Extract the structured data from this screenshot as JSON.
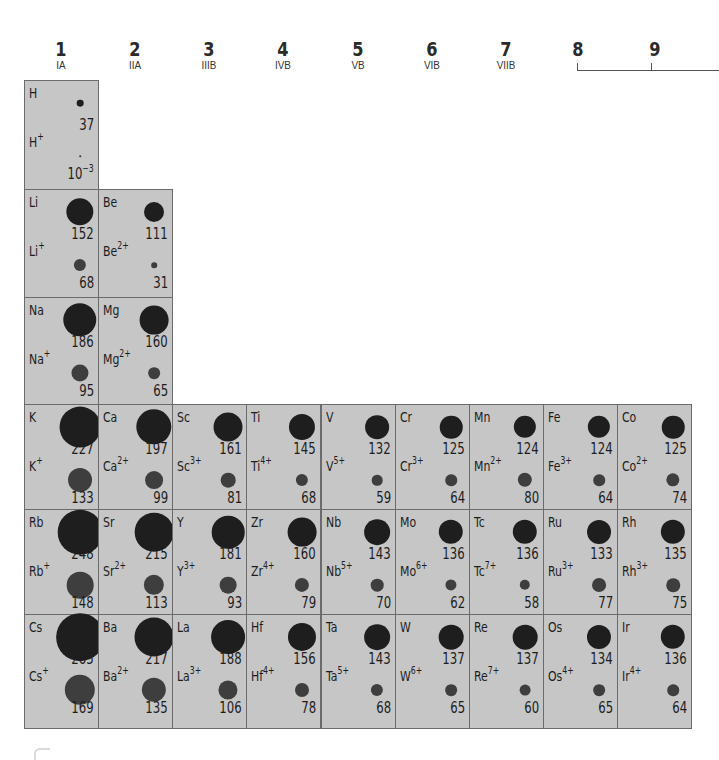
{
  "groups": [
    {
      "num": "1",
      "roman": "IA"
    },
    {
      "num": "2",
      "roman": "IIA"
    },
    {
      "num": "3",
      "roman": "IIIB"
    },
    {
      "num": "4",
      "roman": "IVB"
    },
    {
      "num": "5",
      "roman": "VB"
    },
    {
      "num": "6",
      "roman": "VIB"
    },
    {
      "num": "7",
      "roman": "VIIB"
    },
    {
      "num": "8",
      "roman": ""
    },
    {
      "num": "9",
      "roman": ""
    }
  ],
  "colors": {
    "cell_bg": "#c6c6c6",
    "cell_border": "#6b6b6b",
    "atom_dot": "#1e1e1e",
    "ion_dot": "#3e3e3e"
  },
  "elements": [
    {
      "sym": "H",
      "atomic_radius": "37",
      "ion": "H",
      "charge": "+",
      "ionic_radius": "10",
      "ionic_exp": "−3",
      "col": 0,
      "row": 0
    },
    {
      "sym": "Li",
      "atomic_radius": "152",
      "ion": "Li",
      "charge": "+",
      "ionic_radius": "68",
      "col": 0,
      "row": 1
    },
    {
      "sym": "Be",
      "atomic_radius": "111",
      "ion": "Be",
      "charge": "2+",
      "ionic_radius": "31",
      "col": 1,
      "row": 1
    },
    {
      "sym": "Na",
      "atomic_radius": "186",
      "ion": "Na",
      "charge": "+",
      "ionic_radius": "95",
      "col": 0,
      "row": 2
    },
    {
      "sym": "Mg",
      "atomic_radius": "160",
      "ion": "Mg",
      "charge": "2+",
      "ionic_radius": "65",
      "col": 1,
      "row": 2
    },
    {
      "sym": "K",
      "atomic_radius": "227",
      "ion": "K",
      "charge": "+",
      "ionic_radius": "133",
      "col": 0,
      "row": 3
    },
    {
      "sym": "Ca",
      "atomic_radius": "197",
      "ion": "Ca",
      "charge": "2+",
      "ionic_radius": "99",
      "col": 1,
      "row": 3
    },
    {
      "sym": "Sc",
      "atomic_radius": "161",
      "ion": "Sc",
      "charge": "3+",
      "ionic_radius": "81",
      "col": 2,
      "row": 3
    },
    {
      "sym": "Ti",
      "atomic_radius": "145",
      "ion": "Ti",
      "charge": "4+",
      "ionic_radius": "68",
      "col": 3,
      "row": 3
    },
    {
      "sym": "V",
      "atomic_radius": "132",
      "ion": "V",
      "charge": "5+",
      "ionic_radius": "59",
      "col": 4,
      "row": 3
    },
    {
      "sym": "Cr",
      "atomic_radius": "125",
      "ion": "Cr",
      "charge": "3+",
      "ionic_radius": "64",
      "col": 5,
      "row": 3
    },
    {
      "sym": "Mn",
      "atomic_radius": "124",
      "ion": "Mn",
      "charge": "2+",
      "ionic_radius": "80",
      "col": 6,
      "row": 3
    },
    {
      "sym": "Fe",
      "atomic_radius": "124",
      "ion": "Fe",
      "charge": "3+",
      "ionic_radius": "64",
      "col": 7,
      "row": 3
    },
    {
      "sym": "Co",
      "atomic_radius": "125",
      "ion": "Co",
      "charge": "2+",
      "ionic_radius": "74",
      "col": 8,
      "row": 3
    },
    {
      "sym": "Rb",
      "atomic_radius": "248",
      "ion": "Rb",
      "charge": "+",
      "ionic_radius": "148",
      "col": 0,
      "row": 4
    },
    {
      "sym": "Sr",
      "atomic_radius": "215",
      "ion": "Sr",
      "charge": "2+",
      "ionic_radius": "113",
      "col": 1,
      "row": 4
    },
    {
      "sym": "Y",
      "atomic_radius": "181",
      "ion": "Y",
      "charge": "3+",
      "ionic_radius": "93",
      "col": 2,
      "row": 4
    },
    {
      "sym": "Zr",
      "atomic_radius": "160",
      "ion": "Zr",
      "charge": "4+",
      "ionic_radius": "79",
      "col": 3,
      "row": 4
    },
    {
      "sym": "Nb",
      "atomic_radius": "143",
      "ion": "Nb",
      "charge": "5+",
      "ionic_radius": "70",
      "col": 4,
      "row": 4
    },
    {
      "sym": "Mo",
      "atomic_radius": "136",
      "ion": "Mo",
      "charge": "6+",
      "ionic_radius": "62",
      "col": 5,
      "row": 4
    },
    {
      "sym": "Tc",
      "atomic_radius": "136",
      "ion": "Tc",
      "charge": "7+",
      "ionic_radius": "58",
      "col": 6,
      "row": 4
    },
    {
      "sym": "Ru",
      "atomic_radius": "133",
      "ion": "Ru",
      "charge": "3+",
      "ionic_radius": "77",
      "col": 7,
      "row": 4
    },
    {
      "sym": "Rh",
      "atomic_radius": "135",
      "ion": "Rh",
      "charge": "3+",
      "ionic_radius": "75",
      "col": 8,
      "row": 4
    },
    {
      "sym": "Cs",
      "atomic_radius": "265",
      "ion": "Cs",
      "charge": "+",
      "ionic_radius": "169",
      "col": 0,
      "row": 5
    },
    {
      "sym": "Ba",
      "atomic_radius": "217",
      "ion": "Ba",
      "charge": "2+",
      "ionic_radius": "135",
      "col": 1,
      "row": 5
    },
    {
      "sym": "La",
      "atomic_radius": "188",
      "ion": "La",
      "charge": "3+",
      "ionic_radius": "106",
      "col": 2,
      "row": 5
    },
    {
      "sym": "Hf",
      "atomic_radius": "156",
      "ion": "Hf",
      "charge": "4+",
      "ionic_radius": "78",
      "col": 3,
      "row": 5
    },
    {
      "sym": "Ta",
      "atomic_radius": "143",
      "ion": "Ta",
      "charge": "5+",
      "ionic_radius": "68",
      "col": 4,
      "row": 5
    },
    {
      "sym": "W",
      "atomic_radius": "137",
      "ion": "W",
      "charge": "6+",
      "ionic_radius": "65",
      "col": 5,
      "row": 5
    },
    {
      "sym": "Re",
      "atomic_radius": "137",
      "ion": "Re",
      "charge": "7+",
      "ionic_radius": "60",
      "col": 6,
      "row": 5
    },
    {
      "sym": "Os",
      "atomic_radius": "134",
      "ion": "Os",
      "charge": "4+",
      "ionic_radius": "65",
      "col": 7,
      "row": 5
    },
    {
      "sym": "Ir",
      "atomic_radius": "136",
      "ion": "Ir",
      "charge": "4+",
      "ionic_radius": "64",
      "col": 8,
      "row": 5
    }
  ]
}
